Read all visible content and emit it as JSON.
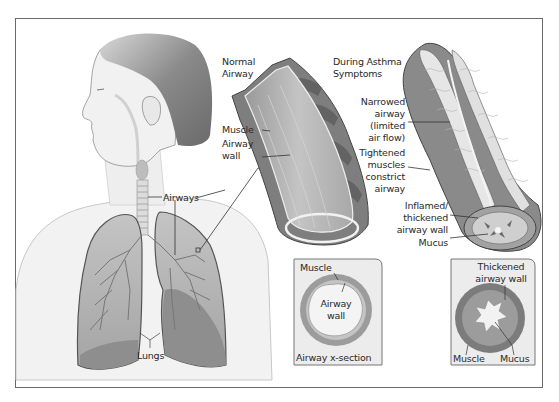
{
  "figure": {
    "person_labels": {
      "airways": "Airways",
      "lungs": "Lungs"
    },
    "normal_airway": {
      "heading_line1": "Normal",
      "heading_line2": "Airway",
      "muscle": "Muscle",
      "airway_wall_line1": "Airway",
      "airway_wall_line2": "wall"
    },
    "asthma_airway": {
      "heading_line1": "During Asthma",
      "heading_line2": "Symptoms",
      "narrowed_line1": "Narrowed",
      "narrowed_line2": "airway",
      "narrowed_line3": "(limited",
      "narrowed_line4": "air flow)",
      "tightened_line1": "Tightened",
      "tightened_line2": "muscles",
      "tightened_line3": "constrict",
      "tightened_line4": "airway",
      "inflamed_line1": "Inflamed/",
      "inflamed_line2": "thickened",
      "inflamed_line3": "airway wall",
      "mucus": "Mucus"
    },
    "normal_cross_section": {
      "muscle": "Muscle",
      "airway_wall_line1": "Airway",
      "airway_wall_line2": "wall",
      "caption": "Airway x-section"
    },
    "asthma_cross_section": {
      "thickened_line1": "Thickened",
      "thickened_line2": "airway wall",
      "muscle": "Muscle",
      "mucus": "Mucus"
    },
    "colors": {
      "frame_border": "#6a6a6a",
      "skin": "#f0f0f0",
      "hair": "#7a7a7a",
      "lung_light": "#b8b8b8",
      "lung_dark": "#8a8a8a",
      "muscle": "#8c8c8c",
      "inset_bg": "#ececec"
    }
  }
}
